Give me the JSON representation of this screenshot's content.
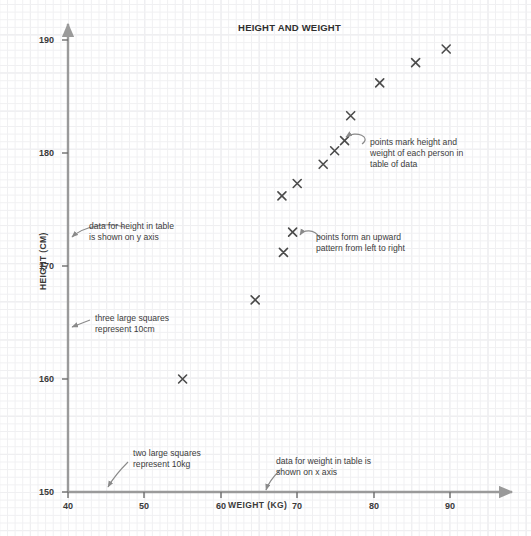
{
  "chart_data": {
    "type": "scatter",
    "title": "HEIGHT AND WEIGHT",
    "xlabel": "WEIGHT (KG)",
    "ylabel": "HEIGHT (CM)",
    "xlim": [
      40,
      95
    ],
    "ylim": [
      150,
      191
    ],
    "xticks": [
      40,
      50,
      60,
      70,
      80,
      90
    ],
    "yticks": [
      150,
      160,
      170,
      180,
      190
    ],
    "grid": true,
    "grid_minor_step_x": 1,
    "grid_minor_step_y": 0.67,
    "grid_major_note": "two large squares represent 10kg on x axis; three large squares represent 10cm on y axis",
    "legend": null,
    "marker": "x",
    "marker_color": "#4a4a4a",
    "points": [
      {
        "weight": 55.0,
        "height": 160.0
      },
      {
        "weight": 64.5,
        "height": 167.0
      },
      {
        "weight": 68.2,
        "height": 171.2
      },
      {
        "weight": 69.4,
        "height": 173.0
      },
      {
        "weight": 68.0,
        "height": 176.2
      },
      {
        "weight": 70.0,
        "height": 177.3
      },
      {
        "weight": 73.4,
        "height": 179.0
      },
      {
        "weight": 74.9,
        "height": 180.2
      },
      {
        "weight": 76.2,
        "height": 181.1
      },
      {
        "weight": 77.0,
        "height": 183.3
      },
      {
        "weight": 80.8,
        "height": 186.2
      },
      {
        "weight": 85.5,
        "height": 188.0
      },
      {
        "weight": 89.5,
        "height": 189.2
      }
    ]
  },
  "annotations": [
    {
      "id": "points-mark",
      "text": "points mark height and\nweight of each person in\ntable of data"
    },
    {
      "id": "upward-pattern",
      "text": "points form an upward\npattern from left to right"
    },
    {
      "id": "height-y-axis",
      "text": "data for height in table\nis shown on y axis"
    },
    {
      "id": "three-squares",
      "text": "three large squares\nrepresent 10cm"
    },
    {
      "id": "two-squares",
      "text": "two large squares\nrepresent 10kg"
    },
    {
      "id": "weight-x-axis",
      "text": "data for weight in table is\nshown on x axis"
    }
  ],
  "axis_ticks": {
    "y": [
      "190",
      "180",
      "170",
      "160",
      "150"
    ],
    "x": [
      "40",
      "50",
      "60",
      "70",
      "80",
      "90"
    ]
  },
  "colors": {
    "axis": "#9a9a9a",
    "marker": "#4a4a4a",
    "text": "#3c3c3c",
    "grid_minor": "#f0f0f2",
    "grid_major": "#e6e6ea"
  }
}
